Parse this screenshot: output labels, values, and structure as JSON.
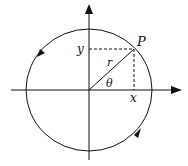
{
  "diagram": {
    "labels": {
      "point": "P",
      "radius": "r",
      "angle": "θ",
      "x_projection": "x",
      "y_projection": "y"
    },
    "colors": {
      "stroke": "#111111",
      "background": "#ffffff"
    },
    "elements": [
      "x-axis with arrow",
      "y-axis with arrow",
      "circle with counterclockwise direction arrows",
      "radius line to P",
      "dashed projections to axes"
    ]
  }
}
